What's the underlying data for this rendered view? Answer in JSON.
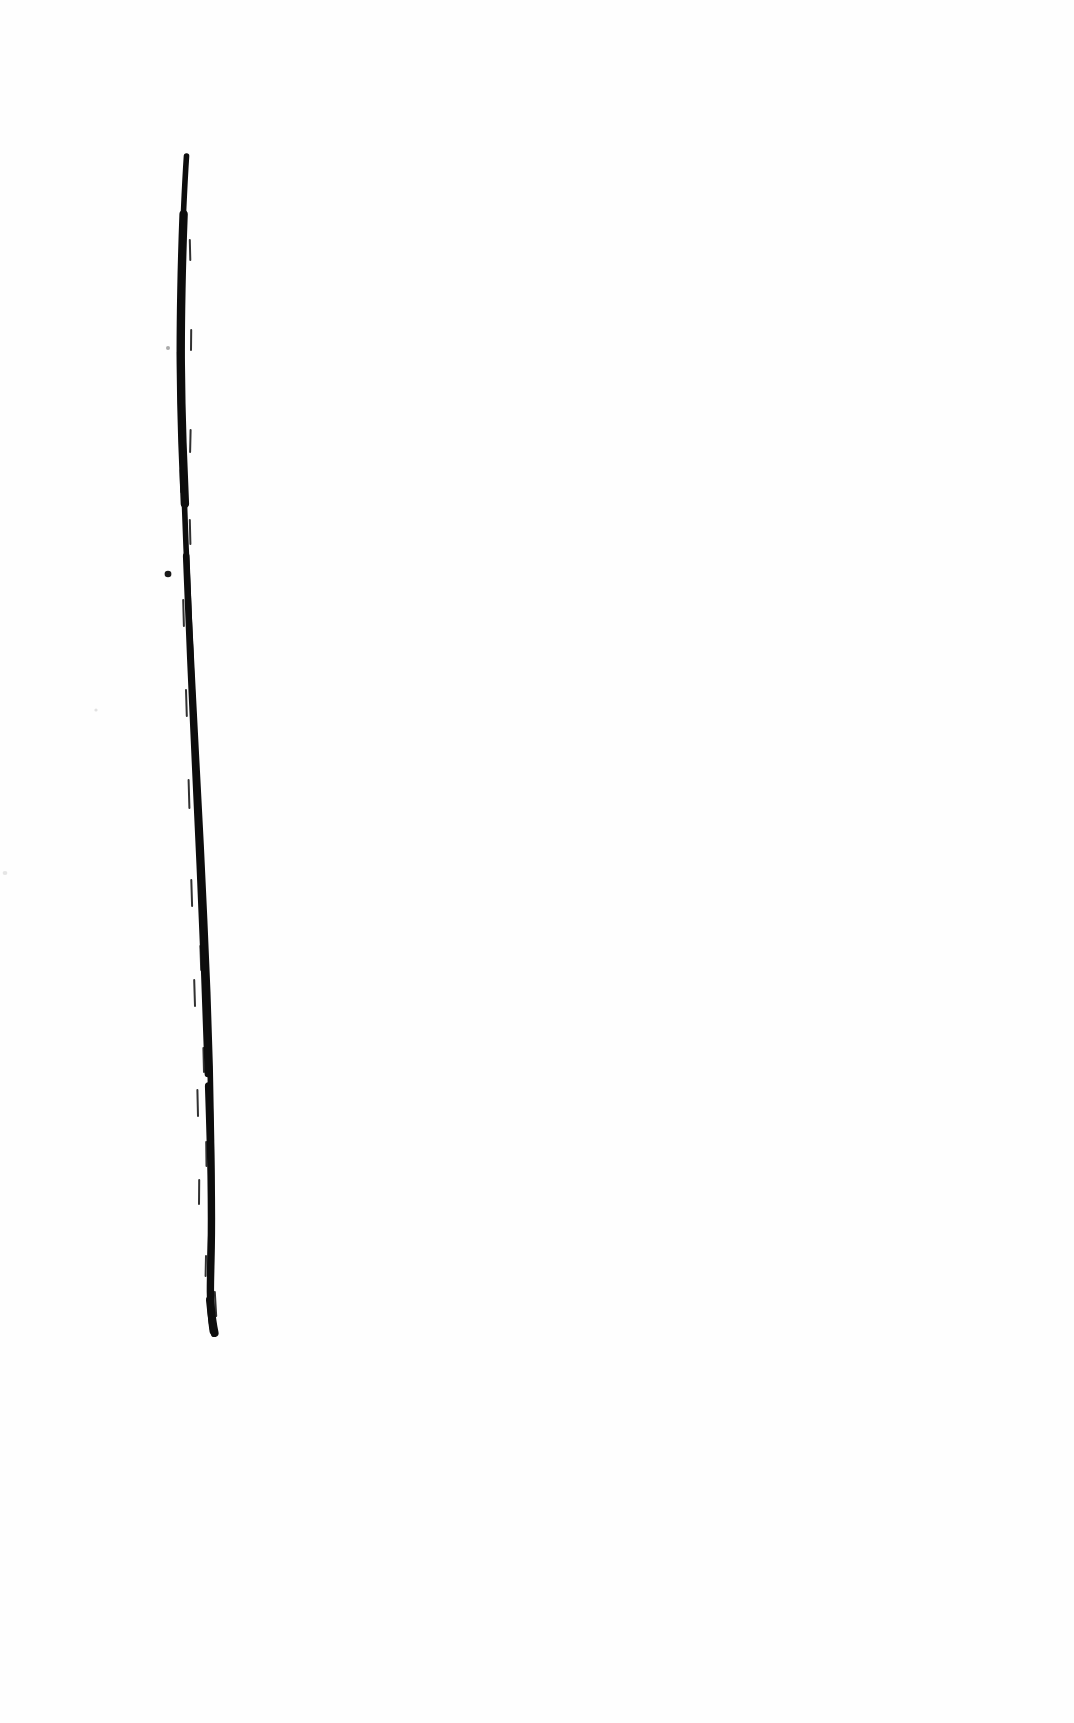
{
  "document": {
    "type": "scanned-page",
    "title": "Scanned page with single vertical ink stroke",
    "page_width": 1074,
    "page_height": 1723,
    "background_color": "#ffffff",
    "paper_tone": "#fefefe",
    "visible_text": "",
    "text_present": false
  },
  "artwork": {
    "name": "vertical-ink-stroke",
    "description": "Single hand-drawn near-vertical ink line, tapered at the top, slightly irregular edges, drifting to the right toward the bottom, blunt tapered end.",
    "ink_color": "#0d0d0d",
    "stroke": {
      "top_point": {
        "x": 186,
        "y": 156
      },
      "bottom_point": {
        "x": 210,
        "y": 1334
      },
      "length_px": 1178,
      "min_width_px": 2,
      "max_width_px": 9,
      "orientation": "vertical",
      "lean_px": 24
    },
    "outline_path": "M186,156 L184,200 L183,250 L182,300 L181,350 L181,400 L182,450 L183,500 L184,560 L185,620 L187,680 L189,740 L191,800 L193,860 L195,920 L197,975 L199,1030 L201,1080 L203,1130 L205,1175 L206,1215 L205,1250 L207,1285 L209,1312 L212,1334 L218,1333 L217,1305 L214,1272 L212,1240 L212,1205 L211,1168 L210,1125 L208,1075 L206,1022 L204,965 L202,908 L200,850 L198,792 L196,735 L194,678 L192,620 L191,562 L190,505 L190,452 L191,398 L192,345 L192,292 L191,240 L189,196 Z",
    "specks": [
      {
        "name": "speck-upper",
        "x": 168,
        "y": 348,
        "w": 4,
        "h": 4,
        "opacity": 0.35
      },
      {
        "name": "speck-mid",
        "x": 168,
        "y": 574,
        "w": 7,
        "h": 7,
        "opacity": 0.95
      },
      {
        "name": "speck-lower",
        "x": 209,
        "y": 1103,
        "w": 4,
        "h": 5,
        "opacity": 0.9
      },
      {
        "name": "speck-faint-left",
        "x": 96,
        "y": 710,
        "w": 3,
        "h": 3,
        "opacity": 0.12
      },
      {
        "name": "speck-faint-edge",
        "x": 5,
        "y": 873,
        "w": 5,
        "h": 4,
        "opacity": 0.1
      }
    ]
  }
}
